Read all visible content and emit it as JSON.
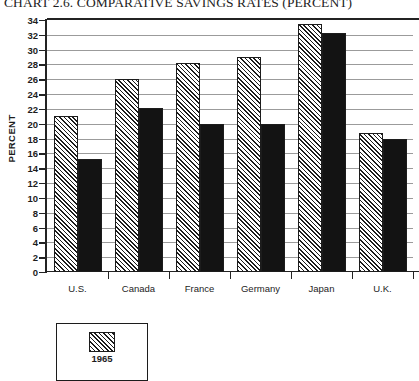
{
  "chart_data": {
    "type": "bar",
    "title": "CHART 2.6. COMPARATIVE SAVINGS RATES (PERCENT)",
    "xlabel": "",
    "ylabel": "PERCENT",
    "ylim": [
      0,
      34
    ],
    "ytick_step": 2,
    "grid": true,
    "legend_position": "bottom-left",
    "categories": [
      "U.S.",
      "Canada",
      "France",
      "Germany",
      "Japan",
      "U.K."
    ],
    "yticks": [
      "0",
      "2",
      "4",
      "6",
      "8",
      "10",
      "12",
      "14",
      "16",
      "18",
      "20",
      "22",
      "24",
      "26",
      "28",
      "30",
      "32",
      "34"
    ],
    "series": [
      {
        "name": "1965",
        "fill": "hatched",
        "values": [
          21.1,
          26.0,
          28.2,
          29.0,
          33.5,
          18.8
        ]
      },
      {
        "name": "",
        "fill": "solid",
        "values": [
          15.2,
          22.1,
          20.0,
          20.0,
          32.2,
          17.9
        ]
      }
    ]
  },
  "legend": {
    "entries": [
      {
        "label": "1965",
        "fill": "hatched"
      }
    ]
  },
  "colors": {
    "axis": "#232323",
    "gridline": "#9b9b9b",
    "bar_solid": "#131313",
    "bar_hatch": "#1c1c1c",
    "background": "#ffffff"
  }
}
